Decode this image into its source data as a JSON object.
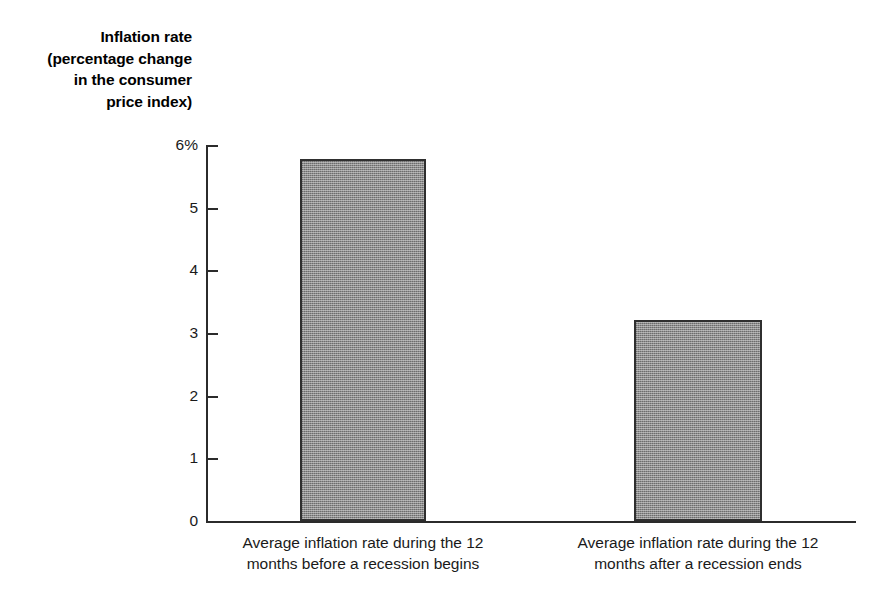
{
  "chart_data": {
    "type": "bar",
    "title": "",
    "xlabel": "",
    "ylabel": "Inflation rate (percentage change in the consumer price index)",
    "ylabel_lines": [
      "Inflation rate",
      "(percentage change",
      "in the consumer",
      "price index)"
    ],
    "categories": [
      "Average inflation rate during the 12 months before a recession begins",
      "Average inflation rate during the 12 months after a recession ends"
    ],
    "category_lines": [
      [
        "Average inflation rate during the 12",
        "months before a recession begins"
      ],
      [
        "Average inflation rate during the 12",
        "months after a recession ends"
      ]
    ],
    "values": [
      5.78,
      3.2
    ],
    "ylim": [
      0,
      6
    ],
    "yticks": [
      0,
      1,
      2,
      3,
      4,
      5,
      6
    ],
    "ytick_labels": [
      "0",
      "1",
      "2",
      "3",
      "4",
      "5",
      "6%"
    ],
    "grid": false,
    "legend": false,
    "colors": {
      "bar_fill": "#8c8c8c",
      "bar_border": "#2f2f2f",
      "axis": "#2b2b2b",
      "text": "#1a1a1a",
      "background": "#ffffff"
    }
  }
}
